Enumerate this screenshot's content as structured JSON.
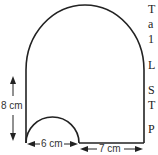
{
  "figure": {
    "labels": {
      "height": "8 cm",
      "small_semicircle_diameter": "6 cm",
      "remaining_base": "7 cm"
    },
    "colors": {
      "stroke": "#222222",
      "text": "#333333"
    }
  },
  "side_text": {
    "lines": [
      "T",
      "a",
      "1",
      "L",
      "S",
      "T",
      "P"
    ]
  }
}
